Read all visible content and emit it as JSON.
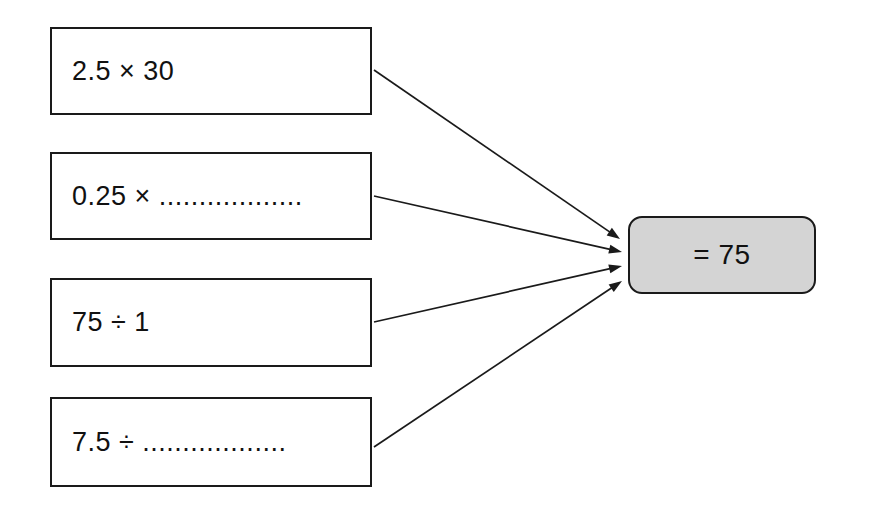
{
  "diagram": {
    "expressions": [
      {
        "id": "expr-1",
        "text": "2.5 × 30",
        "x": 50,
        "y": 27,
        "w": 322,
        "h": 88
      },
      {
        "id": "expr-2",
        "text": "0.25 × ..................",
        "x": 50,
        "y": 152,
        "w": 322,
        "h": 88
      },
      {
        "id": "expr-3",
        "text": "75 ÷ 1",
        "x": 50,
        "y": 278,
        "w": 322,
        "h": 89
      },
      {
        "id": "expr-4",
        "text": "7.5 ÷ ..................",
        "x": 50,
        "y": 397,
        "w": 322,
        "h": 90
      }
    ],
    "result": {
      "text": "= 75",
      "x": 628,
      "y": 216,
      "w": 188,
      "h": 78,
      "fill_color": "#d4d4d4",
      "border_color": "#1a1a1a"
    },
    "arrows": [
      {
        "id": "arrow-1",
        "from_expression": "2.5 × 30",
        "to_result": "= 75",
        "x1": 374,
        "y1": 70,
        "x2": 620,
        "y2": 239
      },
      {
        "id": "arrow-2",
        "from_expression": "0.25 × ..................",
        "to_result": "= 75",
        "x1": 374,
        "y1": 196,
        "x2": 622,
        "y2": 252
      },
      {
        "id": "arrow-3",
        "from_expression": "75 ÷ 1",
        "to_result": "= 75",
        "x1": 374,
        "y1": 322,
        "x2": 622,
        "y2": 266
      },
      {
        "id": "arrow-4",
        "from_expression": "7.5 ÷ ..................",
        "to_result": "= 75",
        "x1": 374,
        "y1": 447,
        "x2": 622,
        "y2": 281
      }
    ],
    "stroke_color": "#1a1a1a",
    "background_color": "#ffffff"
  }
}
